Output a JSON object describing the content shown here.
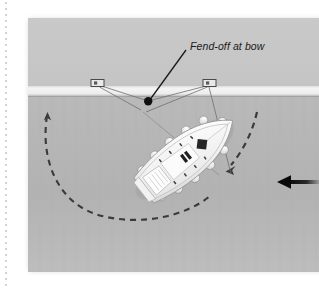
{
  "diagram": {
    "title": "Fend-off at bow",
    "annotations": [
      {
        "id": "fend-off-at-bow",
        "text": "Fend-off at bow",
        "leader_from": [
          187,
          48
        ],
        "leader_to": [
          148,
          101
        ]
      }
    ],
    "scene": {
      "background_color": "#ffffff",
      "water_color": "#b4b4b4",
      "land_color": "#c8c8c8",
      "quay_color": "#f2f2f2",
      "image_area": {
        "x": 28,
        "y": 18,
        "width": 291,
        "height": 254
      }
    },
    "elements": {
      "quay": {
        "name": "quay-edge",
        "y": 92
      },
      "bollards": [
        {
          "name": "bollard-left",
          "x": 97,
          "y": 84
        },
        {
          "name": "bollard-right",
          "x": 210,
          "y": 84
        }
      ],
      "pivot_point": {
        "name": "fend-off-point",
        "x": 148,
        "y": 101
      },
      "mooring_lines": [
        {
          "name": "mooring-line-bow-to-left-bollard",
          "from": [
            148,
            101
          ],
          "to": [
            99,
            86
          ]
        },
        {
          "name": "mooring-line-bow-to-right-bollard",
          "from": [
            148,
            101
          ],
          "to": [
            208,
            86
          ]
        },
        {
          "name": "spring-line-left",
          "from": [
            141,
            110
          ],
          "to": [
            99,
            87
          ]
        },
        {
          "name": "spring-line-right",
          "from": [
            144,
            110
          ],
          "to": [
            209,
            87
          ]
        },
        {
          "name": "stern-line-right",
          "from": [
            209,
            86
          ],
          "to": [
            230,
            173
          ]
        }
      ],
      "boat": {
        "name": "sailboat",
        "bow": [
          146,
          107
        ],
        "stern": [
          224,
          208
        ],
        "heading_deg": 52,
        "fender_count": 11,
        "hull_color": "#f7f7f7"
      },
      "swing_arc": {
        "name": "swing-arc",
        "style": "dashed",
        "color": "#3a3a3a",
        "arrowheads": [
          "left-end-up",
          "right-end-down-left"
        ]
      },
      "wind_arrow": {
        "name": "wind-direction-arrow",
        "direction": "left",
        "x": 273,
        "y": 182,
        "length": 46,
        "color": "#111111"
      },
      "page_edge": {
        "name": "page-edge-dotted-rule",
        "x": 6,
        "color": "#cccccc"
      }
    }
  }
}
